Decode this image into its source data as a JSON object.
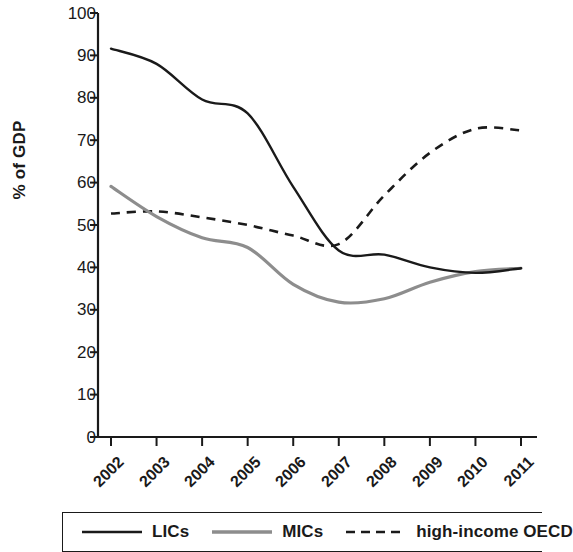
{
  "chart_data": {
    "type": "line",
    "title": "",
    "xlabel": "",
    "ylabel": "% of GDP",
    "xlim": [
      2002,
      2011
    ],
    "ylim": [
      0,
      100
    ],
    "grid": false,
    "legend_position": "bottom",
    "x": [
      2002,
      2003,
      2004,
      2005,
      2006,
      2007,
      2008,
      2009,
      2010,
      2011
    ],
    "xticklabels": [
      "2002",
      "2003",
      "2004",
      "2005",
      "2006",
      "2007",
      "2008",
      "2009",
      "2010",
      "2011"
    ],
    "yticklabels": [
      "0",
      "10",
      "20",
      "30",
      "40",
      "50",
      "60",
      "70",
      "80",
      "90",
      "100"
    ],
    "yticks": [
      0,
      10,
      20,
      30,
      40,
      50,
      60,
      70,
      80,
      90,
      100
    ],
    "series": [
      {
        "name": "LICs",
        "color": "#1a1a1a",
        "style": "solid",
        "values": [
          91.6,
          88.0,
          79.6,
          76.3,
          59.0,
          44.0,
          43.0,
          40.0,
          38.7,
          39.8
        ]
      },
      {
        "name": "MICs",
        "color": "#8d8d8d",
        "style": "solid",
        "values": [
          59.1,
          52.0,
          47.0,
          44.7,
          36.0,
          31.8,
          32.6,
          36.5,
          39.0,
          39.8
        ]
      },
      {
        "name": "high-income OECD",
        "color": "#1a1a1a",
        "style": "dashed",
        "values": [
          52.7,
          53.2,
          51.8,
          50.0,
          47.5,
          45.5,
          57.0,
          67.0,
          72.7,
          72.3
        ]
      }
    ]
  },
  "legend": {
    "items": [
      {
        "label": "LICs",
        "swatch": "solid-black-line-icon"
      },
      {
        "label": "MICs",
        "swatch": "solid-gray-line-icon"
      },
      {
        "label": "high-income OECD",
        "swatch": "dashed-black-line-icon"
      }
    ]
  },
  "colors": {
    "lics": "#1a1a1a",
    "mics": "#8d8d8d",
    "oecd": "#1a1a1a",
    "axis": "#1a1a1a",
    "background": "#ffffff"
  }
}
